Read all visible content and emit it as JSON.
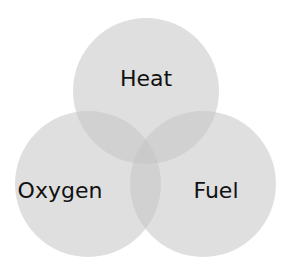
{
  "diagram": {
    "type": "venn",
    "sets": [
      {
        "label": "Heat",
        "cx": 146,
        "cy": 91,
        "r": 73
      },
      {
        "label": "Oxygen",
        "cx": 88,
        "cy": 184,
        "r": 73
      },
      {
        "label": "Fuel",
        "cx": 203,
        "cy": 184,
        "r": 73
      }
    ],
    "colors": {
      "circle": "#dcdcdc",
      "overlap_opacity": "0.55"
    }
  }
}
